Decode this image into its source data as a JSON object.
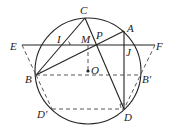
{
  "diagram": {
    "type": "geometry",
    "circle": {
      "center": "O",
      "cx": 88,
      "cy": 71,
      "r": 53
    },
    "points": {
      "C": {
        "label": "C",
        "x": 85,
        "y": 18,
        "lx": 80,
        "ly": 14
      },
      "A": {
        "label": "A",
        "x": 124,
        "y": 31,
        "lx": 127,
        "ly": 32
      },
      "E": {
        "label": "E",
        "x": 22,
        "y": 45,
        "lx": 10,
        "ly": 50
      },
      "F": {
        "label": "F",
        "x": 155,
        "y": 45,
        "lx": 156,
        "ly": 50
      },
      "I": {
        "label": "I",
        "x": 66,
        "y": 45,
        "lx": 57,
        "ly": 43
      },
      "M": {
        "label": "M",
        "x": 88,
        "y": 45,
        "lx": 81,
        "ly": 43
      },
      "P": {
        "label": "P",
        "x": 96,
        "y": 45,
        "lx": 96,
        "ly": 39
      },
      "J": {
        "label": "J",
        "x": 124,
        "y": 45,
        "lx": 126,
        "ly": 56
      },
      "O": {
        "label": "O",
        "x": 88,
        "y": 71,
        "lx": 91,
        "ly": 74
      },
      "B": {
        "label": "B",
        "x": 36,
        "y": 75,
        "lx": 25,
        "ly": 83
      },
      "B'": {
        "label": "B′",
        "x": 140,
        "y": 75,
        "lx": 142,
        "ly": 83
      },
      "D'": {
        "label": "D′",
        "x": 52,
        "y": 109,
        "lx": 37,
        "ly": 118
      },
      "D": {
        "label": "D",
        "x": 124,
        "y": 109,
        "lx": 124,
        "ly": 121
      }
    },
    "solid_segments": [
      [
        "E",
        "F"
      ],
      [
        "C",
        "B"
      ],
      [
        "C",
        "D"
      ],
      [
        "B",
        "A"
      ],
      [
        "A",
        "D"
      ]
    ],
    "dashed_segments": [
      [
        "E",
        "B"
      ],
      [
        "B",
        "D'"
      ],
      [
        "F",
        "D"
      ],
      [
        "B",
        "B'"
      ],
      [
        "D'",
        "D"
      ],
      [
        "M",
        "O"
      ]
    ],
    "colors": {
      "line": "#222222",
      "background": "#ffffff"
    }
  }
}
